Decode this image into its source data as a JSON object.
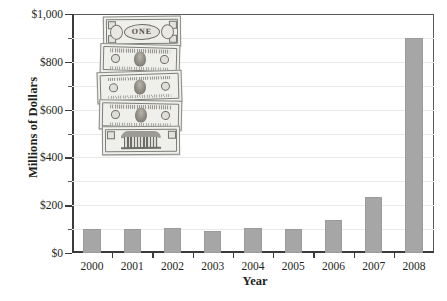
{
  "chart_data": {
    "type": "bar",
    "title": "",
    "subtitle": "",
    "xlabel": "Year",
    "ylabel": "Millions of Dollars",
    "categories": [
      "2000",
      "2001",
      "2002",
      "2003",
      "2004",
      "2005",
      "2006",
      "2007",
      "2008"
    ],
    "values": [
      100,
      100,
      105,
      93,
      105,
      100,
      140,
      235,
      900
    ],
    "ylim": [
      0,
      1000
    ],
    "ytick_major_values": [
      0,
      200,
      400,
      600,
      800,
      1000
    ],
    "ytick_major_labels": [
      "$0",
      "$200",
      "$400",
      "$600",
      "$800",
      "$1,000"
    ],
    "ytick_minor_values": [
      100,
      300,
      500,
      700,
      900
    ],
    "grid": "horizontal",
    "legend": "none",
    "series": [
      {
        "name": "Millions of Dollars",
        "values": [
          100,
          100,
          105,
          93,
          105,
          100,
          140,
          235,
          900
        ]
      }
    ],
    "colors": {
      "bar_fill": "#a6a6a6",
      "bar_stroke": "#9b9b9b",
      "gridline": "#e9e9ea",
      "axis": "#3b3b3d",
      "text": "#231f20"
    }
  },
  "annotations": {
    "money_stack": {
      "name": "stack-of-us-banknotes-photo",
      "notes": [
        {
          "label": "one-dollar-note-front"
        },
        {
          "label": "banknote-portrait-2"
        },
        {
          "label": "banknote-portrait-3"
        },
        {
          "label": "banknote-portrait-4"
        },
        {
          "label": "banknote-building-reverse"
        }
      ]
    }
  }
}
